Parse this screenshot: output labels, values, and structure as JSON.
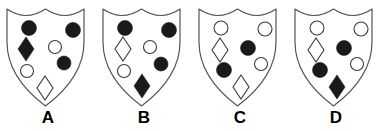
{
  "board": {
    "title": "Shield pattern comparison",
    "background_color": "#ffffff",
    "outline_color": "#555555",
    "fill_dark_color": "#1a1a1a",
    "fill_light_color": "#ffffff"
  },
  "shields": [
    {
      "label": "A",
      "name": "shield-a",
      "charges": [
        {
          "shape": "circle",
          "fill": "dark",
          "cx": 29,
          "cy": 26,
          "r": 7.5,
          "name": "charge-circle-top-left"
        },
        {
          "shape": "circle",
          "fill": "dark",
          "cx": 73,
          "cy": 28,
          "r": 7.5,
          "name": "charge-circle-top-right"
        },
        {
          "shape": "diamond",
          "fill": "dark",
          "cx": 26,
          "cy": 47,
          "rx": 8,
          "ry": 12,
          "name": "charge-diamond-left"
        },
        {
          "shape": "circle",
          "fill": "light",
          "cx": 55,
          "cy": 45,
          "r": 6.5,
          "name": "charge-circle-center"
        },
        {
          "shape": "circle",
          "fill": "dark",
          "cx": 64,
          "cy": 61,
          "r": 7,
          "name": "charge-circle-right-mid"
        },
        {
          "shape": "circle",
          "fill": "light",
          "cx": 27,
          "cy": 69,
          "r": 6.5,
          "name": "charge-circle-lower-left"
        },
        {
          "shape": "diamond",
          "fill": "light",
          "cx": 45,
          "cy": 86,
          "rx": 8,
          "ry": 12,
          "name": "charge-diamond-bottom"
        }
      ]
    },
    {
      "label": "B",
      "name": "shield-b",
      "charges": [
        {
          "shape": "circle",
          "fill": "dark",
          "cx": 29,
          "cy": 26,
          "r": 7.5,
          "name": "charge-circle-top-left"
        },
        {
          "shape": "circle",
          "fill": "dark",
          "cx": 73,
          "cy": 28,
          "r": 7.5,
          "name": "charge-circle-top-right"
        },
        {
          "shape": "diamond",
          "fill": "light",
          "cx": 27,
          "cy": 47,
          "rx": 8,
          "ry": 12,
          "name": "charge-diamond-left"
        },
        {
          "shape": "circle",
          "fill": "light",
          "cx": 54,
          "cy": 45,
          "r": 6.5,
          "name": "charge-circle-center"
        },
        {
          "shape": "circle",
          "fill": "dark",
          "cx": 65,
          "cy": 62,
          "r": 7,
          "name": "charge-circle-right-mid"
        },
        {
          "shape": "circle",
          "fill": "light",
          "cx": 28,
          "cy": 69,
          "r": 6.5,
          "name": "charge-circle-lower-left"
        },
        {
          "shape": "diamond",
          "fill": "dark",
          "cx": 46,
          "cy": 84,
          "rx": 8,
          "ry": 12,
          "name": "charge-diamond-bottom"
        }
      ]
    },
    {
      "label": "C",
      "name": "shield-c",
      "charges": [
        {
          "shape": "circle",
          "fill": "light",
          "cx": 29,
          "cy": 26,
          "r": 7,
          "name": "charge-circle-top-left"
        },
        {
          "shape": "circle",
          "fill": "light",
          "cx": 73,
          "cy": 27,
          "r": 7,
          "name": "charge-circle-top-right"
        },
        {
          "shape": "diamond",
          "fill": "light",
          "cx": 28,
          "cy": 48,
          "rx": 8,
          "ry": 12,
          "name": "charge-diamond-left"
        },
        {
          "shape": "circle",
          "fill": "dark",
          "cx": 56,
          "cy": 46,
          "r": 7.5,
          "name": "charge-circle-center"
        },
        {
          "shape": "circle",
          "fill": "light",
          "cx": 69,
          "cy": 62,
          "r": 6.5,
          "name": "charge-circle-right-mid"
        },
        {
          "shape": "circle",
          "fill": "dark",
          "cx": 32,
          "cy": 68,
          "r": 7.5,
          "name": "charge-circle-lower-left"
        },
        {
          "shape": "diamond",
          "fill": "light",
          "cx": 49,
          "cy": 85,
          "rx": 8,
          "ry": 12,
          "name": "charge-diamond-bottom"
        }
      ]
    },
    {
      "label": "D",
      "name": "shield-d",
      "charges": [
        {
          "shape": "circle",
          "fill": "light",
          "cx": 29,
          "cy": 26,
          "r": 7,
          "name": "charge-circle-top-left"
        },
        {
          "shape": "circle",
          "fill": "light",
          "cx": 73,
          "cy": 27,
          "r": 7,
          "name": "charge-circle-top-right"
        },
        {
          "shape": "diamond",
          "fill": "light",
          "cx": 28,
          "cy": 48,
          "rx": 8,
          "ry": 12,
          "name": "charge-diamond-left"
        },
        {
          "shape": "circle",
          "fill": "dark",
          "cx": 56,
          "cy": 46,
          "r": 7.5,
          "name": "charge-circle-center"
        },
        {
          "shape": "circle",
          "fill": "light",
          "cx": 69,
          "cy": 62,
          "r": 6.5,
          "name": "charge-circle-right-mid"
        },
        {
          "shape": "circle",
          "fill": "dark",
          "cx": 32,
          "cy": 68,
          "r": 7.5,
          "name": "charge-circle-lower-left"
        },
        {
          "shape": "diamond",
          "fill": "dark",
          "cx": 49,
          "cy": 85,
          "rx": 8,
          "ry": 12,
          "name": "charge-diamond-bottom"
        }
      ]
    }
  ]
}
